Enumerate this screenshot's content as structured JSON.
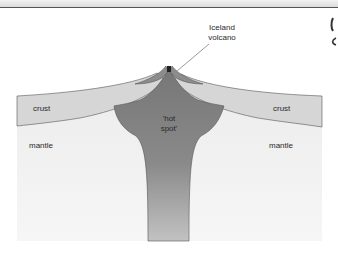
{
  "diagram": {
    "type": "cross-section",
    "labels": {
      "volcano_line1": "Iceland",
      "volcano_line2": "volcano",
      "crust_left": "crust",
      "crust_right": "crust",
      "mantle_left": "mantle",
      "mantle_right": "mantle",
      "hotspot_line1": "'hot",
      "hotspot_line2": "spot'"
    },
    "colors": {
      "page_bg": "#ffffff",
      "mantle": "#f0f0f0",
      "crust": "#d6d6d6",
      "volcano_flank": "#8c8c8c",
      "hotspot_top": "#7a7a7a",
      "hotspot_bottom": "#bdbdbd",
      "outline": "#555555",
      "vent": "#222222",
      "top_rule": "#555555"
    }
  }
}
